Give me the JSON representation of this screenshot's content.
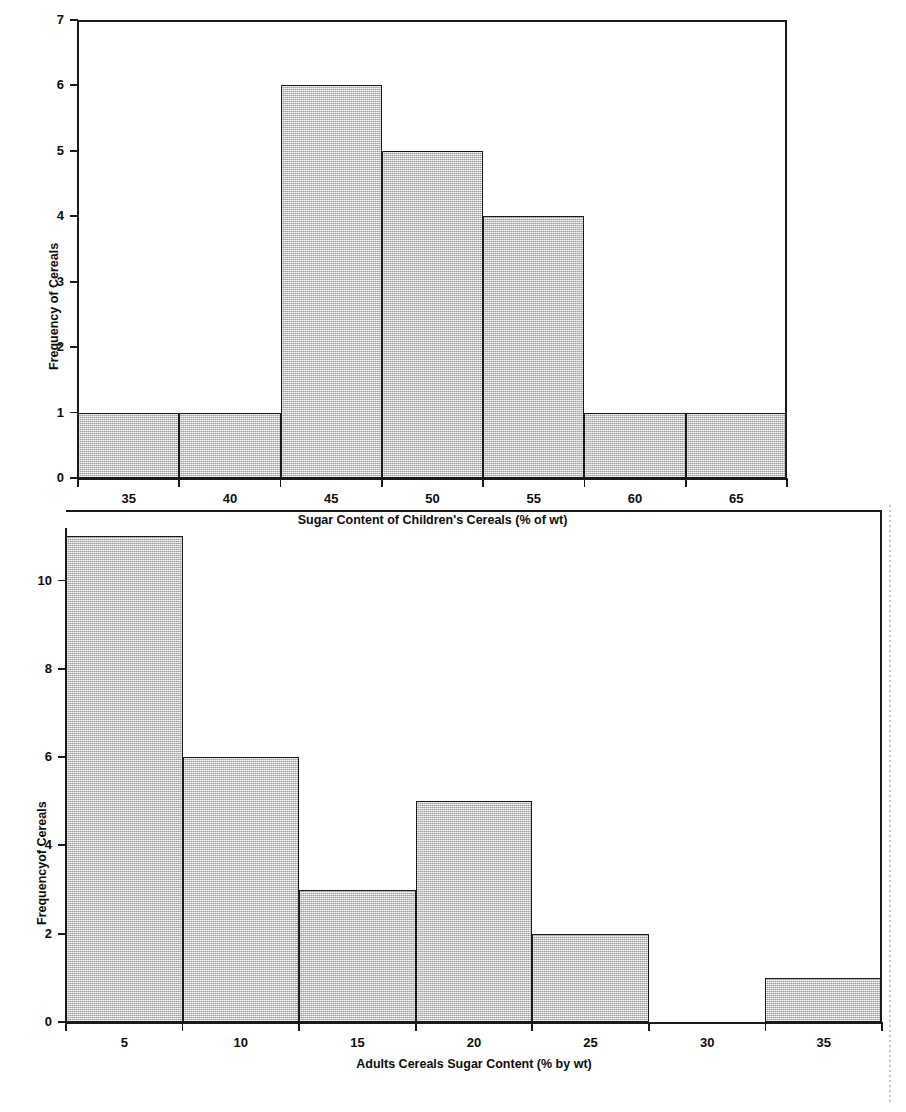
{
  "chart_data": [
    {
      "type": "bar",
      "id": "childrens-cereals-histogram",
      "title": "",
      "xlabel": "Sugar Content of Children's Cereals (% of wt)",
      "ylabel": "Frequency of Cereals",
      "categories": [
        "35",
        "40",
        "45",
        "50",
        "55",
        "60",
        "65"
      ],
      "values": [
        1,
        1,
        6,
        5,
        4,
        1,
        1
      ],
      "bin_edges": [
        32.5,
        37.5,
        42.5,
        47.5,
        52.5,
        57.5,
        62.5,
        67.5
      ],
      "xticks": [
        "35",
        "40",
        "45",
        "50",
        "55",
        "60",
        "65"
      ],
      "yticks": [
        "0",
        "1",
        "2",
        "3",
        "4",
        "5",
        "6",
        "7"
      ],
      "ylim": [
        0,
        7
      ],
      "xlim": [
        32.5,
        67.5
      ],
      "grid": false,
      "legend": false,
      "bar_fill_color": "#d2d2d2",
      "bar_edge_color": "#1a1a1a"
    },
    {
      "type": "bar",
      "id": "adults-cereals-histogram",
      "title": "",
      "xlabel": "Adults Cereals Sugar Content (% by wt)",
      "ylabel": "Frequencyof Cereals",
      "categories": [
        "5",
        "10",
        "15",
        "20",
        "25",
        "30",
        "35"
      ],
      "values": [
        11,
        6,
        3,
        5,
        2,
        0,
        1
      ],
      "bin_edges": [
        2.5,
        7.5,
        12.5,
        17.5,
        22.5,
        27.5,
        32.5,
        37.5
      ],
      "xticks": [
        "5",
        "10",
        "15",
        "20",
        "25",
        "30",
        "35"
      ],
      "yticks": [
        "0",
        "2",
        "4",
        "6",
        "8",
        "10"
      ],
      "ylim": [
        0,
        11.6
      ],
      "xlim": [
        2.5,
        37.5
      ],
      "grid": false,
      "legend": false,
      "bar_fill_color": "#d2d2d2",
      "bar_edge_color": "#1a1a1a"
    }
  ],
  "figure": {
    "background_color": "#ffffff",
    "axis_color": "#1a1a1a",
    "text_color": "#0d0d0d"
  }
}
